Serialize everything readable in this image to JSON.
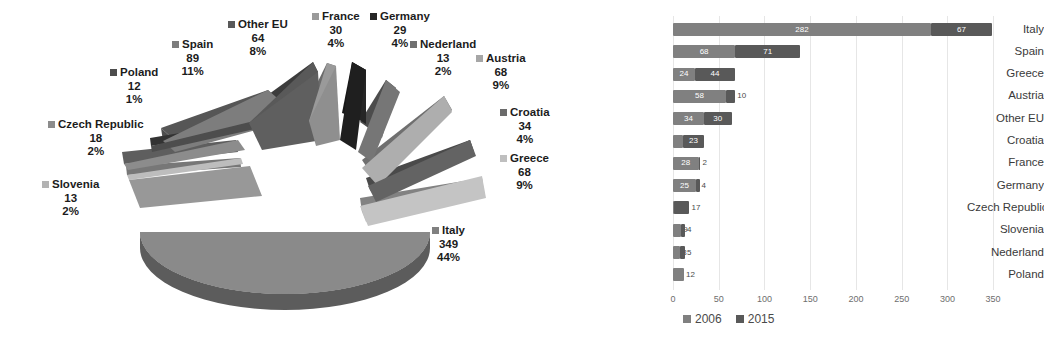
{
  "chart_data": [
    {
      "type": "pie",
      "title": "",
      "id": "pie-2015-shares",
      "labels": [
        "Italy",
        "Spain",
        "Austria",
        "Greece",
        "Other EU",
        "Croatia",
        "France",
        "Germany",
        "Czech Republic",
        "Slovenia",
        "Nederland",
        "Poland"
      ],
      "values": [
        349,
        89,
        68,
        68,
        64,
        34,
        30,
        29,
        18,
        13,
        12,
        12
      ],
      "percents": [
        "44%",
        "11%",
        "9%",
        "9%",
        "8%",
        "4%",
        "4%",
        "4%",
        "2%",
        "2%",
        "2%",
        "1%"
      ],
      "colors": [
        "#808080",
        "#7d7d7d",
        "#a6a6a6",
        "#bfbfbf",
        "#595959",
        "#6b6b6b",
        "#9a9a9a",
        "#262626",
        "#8c8c8c",
        "#b3b3b3",
        "#707070",
        "#4d4d4d"
      ],
      "legend": "none",
      "exploded": true,
      "three_d": true,
      "label_format": "name + value + percent"
    },
    {
      "type": "bar",
      "orientation": "horizontal",
      "stacked": true,
      "id": "bar-2006-2015",
      "title": "",
      "xlabel": "",
      "ylabel": "",
      "categories": [
        "Italy",
        "Spain",
        "Greece",
        "Austria",
        "Other EU",
        "Croatia",
        "France",
        "Germany",
        "Czech Republic",
        "Slovenia",
        "Nederland",
        "Poland"
      ],
      "series": [
        {
          "name": "2006",
          "color": "#808080",
          "values": [
            282,
            68,
            24,
            58,
            34,
            11,
            28,
            25,
            1,
            9,
            8,
            12
          ]
        },
        {
          "name": "2015",
          "color": "#595959",
          "values": [
            67,
            71,
            44,
            10,
            30,
            23,
            2,
            4,
            17,
            4,
            5,
            0
          ]
        }
      ],
      "xlim": [
        0,
        375
      ],
      "xticks": [
        0,
        50,
        100,
        150,
        200,
        250,
        300,
        350
      ],
      "xtick_labels": [
        "0",
        "50",
        "100",
        "150",
        "200",
        "250",
        "300",
        "350"
      ],
      "grid": true,
      "legend_position": "bottom"
    }
  ],
  "pie_labels": [
    {
      "name": "Other EU",
      "value": "64",
      "percent": "8%",
      "color": "#595959"
    },
    {
      "name": "France",
      "value": "30",
      "percent": "4%",
      "color": "#9a9a9a"
    },
    {
      "name": "Germany",
      "value": "29",
      "percent": "4%",
      "color": "#262626"
    },
    {
      "name": "Nederland",
      "value": "13",
      "percent": "2%",
      "color": "#707070"
    },
    {
      "name": "Austria",
      "value": "68",
      "percent": "9%",
      "color": "#a6a6a6"
    },
    {
      "name": "Croatia",
      "value": "34",
      "percent": "4%",
      "color": "#6b6b6b"
    },
    {
      "name": "Greece",
      "value": "68",
      "percent": "9%",
      "color": "#bfbfbf"
    },
    {
      "name": "Italy",
      "value": "349",
      "percent": "44%",
      "color": "#808080"
    },
    {
      "name": "Slovenia",
      "value": "13",
      "percent": "2%",
      "color": "#b3b3b3"
    },
    {
      "name": "Czech Republic",
      "value": "18",
      "percent": "2%",
      "color": "#8c8c8c"
    },
    {
      "name": "Poland",
      "value": "12",
      "percent": "1%",
      "color": "#4d4d4d"
    },
    {
      "name": "Spain",
      "value": "89",
      "percent": "11%",
      "color": "#7d7d7d"
    }
  ],
  "bar_legend": [
    {
      "label": "2006",
      "color": "#808080"
    },
    {
      "label": "2015",
      "color": "#595959"
    }
  ],
  "axis": {
    "ticks": [
      "0",
      "50",
      "100",
      "150",
      "200",
      "250",
      "300",
      "350"
    ]
  }
}
